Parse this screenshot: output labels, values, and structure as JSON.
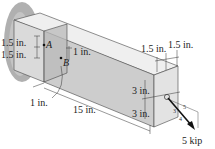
{
  "diagram": {
    "type": "engineering-statics",
    "colors": {
      "top_face": "#ececec",
      "front_face": "#cfcfcf",
      "end_face": "#e2e2e2",
      "section_plane": "#b8b8b8",
      "wall_shadow": "#a9a9a9",
      "line": "#333333",
      "force_arrow": "#111111"
    },
    "points": {
      "A": "A",
      "B": "B"
    },
    "dimensions": {
      "a_top": "1.5 in.",
      "a_bottom": "1.5 in.",
      "b_offset": "1 in.",
      "section_distance": "1 in.",
      "beam_length": "15 in.",
      "end_width_left": "1.5 in.",
      "end_width_right": "1.5 in.",
      "end_height_top": "3 in.",
      "end_height_bottom": "3 in."
    },
    "load": {
      "magnitude": "5 kip",
      "slope_hyp": "5",
      "slope_leg_a": "3",
      "slope_leg_b": "4"
    }
  }
}
